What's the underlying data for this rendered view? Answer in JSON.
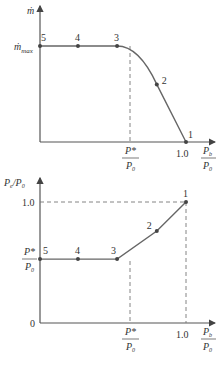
{
  "chart_data": [
    {
      "type": "line",
      "title": "",
      "ylabel": "ṁ",
      "xlabel": "P_b / P_0",
      "y_tick_labels": [
        "ṁ_max"
      ],
      "x_tick_labels": [
        "P*/P_0",
        "1.0"
      ],
      "x_tick_values": {
        "P*/P_0": 0.528,
        "1.0": 1.0
      },
      "xlim": [
        0,
        1.15
      ],
      "ylim": [
        0,
        1.4
      ],
      "grid": false,
      "points": [
        {
          "label": "5",
          "x": 0.0,
          "y": 1.0
        },
        {
          "label": "4",
          "x": 0.26,
          "y": 1.0
        },
        {
          "label": "3",
          "x": 0.528,
          "y": 1.0
        },
        {
          "label": "2",
          "x": 0.8,
          "y": 0.6
        },
        {
          "label": "1",
          "x": 1.0,
          "y": 0.0
        }
      ],
      "ymax_label": "ṁ_max"
    },
    {
      "type": "line",
      "title": "",
      "ylabel": "P_e / P_0",
      "xlabel": "P_b / P_0",
      "y_tick_labels": [
        "1.0",
        "P*/P_0",
        "0"
      ],
      "x_tick_labels": [
        "P*/P_0",
        "1.0"
      ],
      "xlim": [
        0,
        1.15
      ],
      "ylim": [
        0,
        1.15
      ],
      "grid": false,
      "points": [
        {
          "label": "5",
          "x": 0.0,
          "y": 0.528
        },
        {
          "label": "4",
          "x": 0.26,
          "y": 0.528
        },
        {
          "label": "3",
          "x": 0.528,
          "y": 0.528
        },
        {
          "label": "2",
          "x": 0.8,
          "y": 0.76
        },
        {
          "label": "1",
          "x": 1.0,
          "y": 1.0
        }
      ]
    }
  ],
  "labels": {
    "top_y_axis": "ṁ",
    "mmax_main": "ṁ",
    "mmax_sub": "max",
    "x_axis_num": "P",
    "x_axis_num_sub": "b",
    "x_axis_den": "P",
    "x_axis_den_sub": "0",
    "pstar_num": "P*",
    "pstar_den": "P",
    "pstar_den_sub": "0",
    "one": "1.0",
    "zero": "0",
    "bottom_y_axis_main": "P",
    "bottom_y_axis_sub": "e",
    "bottom_y_axis_slash": "/P",
    "bottom_y_axis_sub2": "0"
  }
}
